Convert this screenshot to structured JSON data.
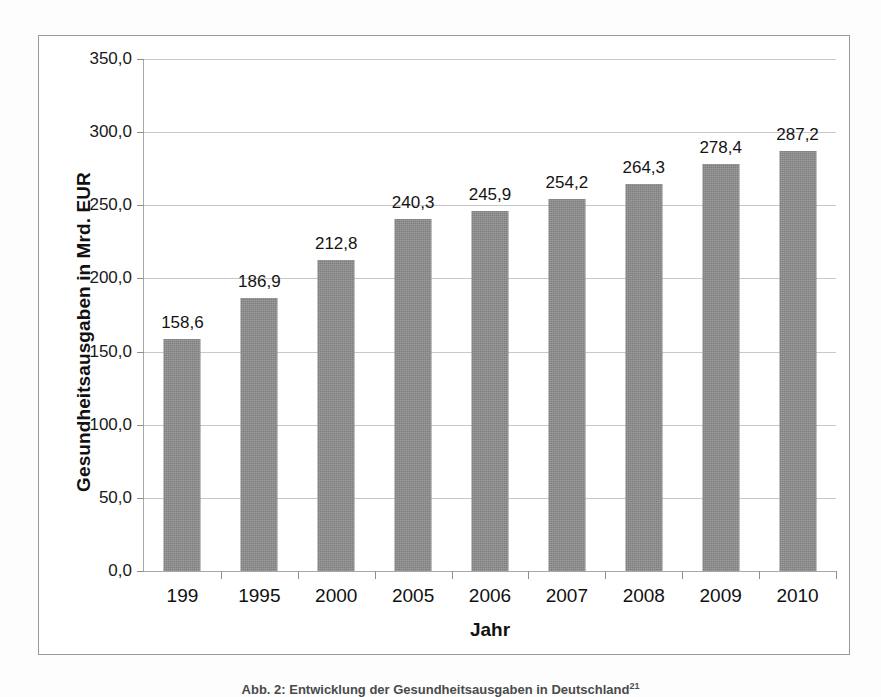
{
  "page": {
    "caption": "Abb. 2: Entwicklung der Gesundheitsausgaben in Deutschland",
    "caption_footnote": "21"
  },
  "chart_data": {
    "type": "bar",
    "title": "",
    "xlabel": "Jahr",
    "ylabel": "Gesundheitsausgaben in Mrd. EUR",
    "categories": [
      "199",
      "1995",
      "2000",
      "2005",
      "2006",
      "2007",
      "2008",
      "2009",
      "2010"
    ],
    "values": [
      158.6,
      186.9,
      212.8,
      240.3,
      245.9,
      254.2,
      264.3,
      278.4,
      287.2
    ],
    "value_labels": [
      "158,6",
      "186,9",
      "212,8",
      "240,3",
      "245,9",
      "254,2",
      "264,3",
      "278,4",
      "287,2"
    ],
    "ylim": [
      0,
      350
    ],
    "ytick_values": [
      0,
      50,
      100,
      150,
      200,
      250,
      300,
      350
    ],
    "ytick_labels": [
      "0,0",
      "50,0",
      "100,0",
      "150,0",
      "200,0",
      "250,0",
      "300,0",
      "350,0"
    ],
    "grid": true,
    "legend": false,
    "bar_color": "#7f7f7f",
    "gridline_color": "#c8c8c8",
    "axis_color": "#a8a8a8",
    "frame_color": "#9a9a9a"
  }
}
